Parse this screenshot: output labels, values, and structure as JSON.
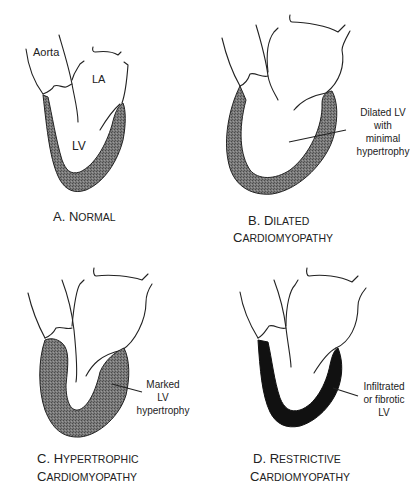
{
  "figure": {
    "panels": [
      {
        "id": "A",
        "caption_letter": "A. ",
        "caption_line1_initial": "N",
        "caption_line1_rest": "ORMAL",
        "caption_line2_initial": "",
        "caption_line2_rest": "",
        "structure_labels": [
          "Aorta",
          "LA",
          "LV"
        ],
        "annotation": [],
        "wall_fill": "stippled-gray"
      },
      {
        "id": "B",
        "caption_letter": "B. ",
        "caption_line1_initial": "D",
        "caption_line1_rest": "ILATED",
        "caption_line2_initial": "C",
        "caption_line2_rest": "ARDIOMYOPATHY",
        "structure_labels": [],
        "annotation": [
          "Dilated LV",
          "with",
          "minimal",
          "hypertrophy"
        ],
        "wall_fill": "stippled-gray"
      },
      {
        "id": "C",
        "caption_letter": "C. ",
        "caption_line1_initial": "H",
        "caption_line1_rest": "YPERTROPHIC",
        "caption_line2_initial": "C",
        "caption_line2_rest": "ARDIOMYOPATHY",
        "structure_labels": [],
        "annotation": [
          "Marked",
          "LV",
          "hypertrophy"
        ],
        "wall_fill": "stippled-gray"
      },
      {
        "id": "D",
        "caption_letter": "D. ",
        "caption_line1_initial": "R",
        "caption_line1_rest": "ESTRICTIVE",
        "caption_line2_initial": "C",
        "caption_line2_rest": "ARDIOMYOPATHY",
        "structure_labels": [],
        "annotation": [
          "Infiltrated",
          "or fibrotic",
          "LV"
        ],
        "wall_fill": "solid-black"
      }
    ],
    "colors": {
      "wall_gray": "#6e6e6e",
      "wall_black": "#111111",
      "outline": "#222222",
      "background": "#ffffff"
    }
  }
}
